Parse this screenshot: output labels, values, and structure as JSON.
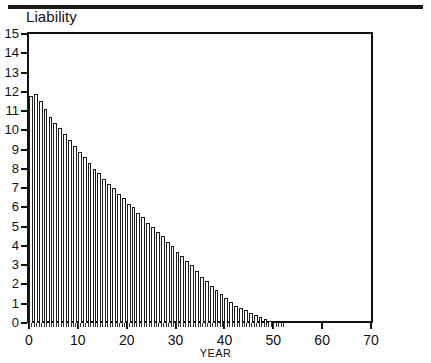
{
  "figure": {
    "title_axis_label": "Liability",
    "x_caption": "YEAR"
  },
  "chart_data": {
    "type": "bar",
    "title": "",
    "ylabel": "Liability",
    "xlabel": "YEAR",
    "ylim": [
      0,
      15
    ],
    "xlim": [
      0,
      70
    ],
    "ytick_labels": [
      "0",
      "1",
      "2",
      "3",
      "4",
      "5",
      "6",
      "7",
      "8",
      "9",
      "10",
      "11",
      "12",
      "13",
      "14",
      "15"
    ],
    "ytick_values": [
      0,
      1,
      2,
      3,
      4,
      5,
      6,
      7,
      8,
      9,
      10,
      11,
      12,
      13,
      14,
      15
    ],
    "xtick_labels": [
      "0",
      "10",
      "20",
      "30",
      "40",
      "50",
      "60",
      "70"
    ],
    "xtick_values": [
      0,
      10,
      20,
      30,
      40,
      50,
      60,
      70
    ],
    "grid": false,
    "legend": null,
    "bar_style": {
      "fill": "#ffffff",
      "edge": "#1c1c1c",
      "edge_width_px": 1
    },
    "categories": [
      1,
      2,
      3,
      4,
      5,
      6,
      7,
      8,
      9,
      10,
      11,
      12,
      13,
      14,
      15,
      16,
      17,
      18,
      19,
      20,
      21,
      22,
      23,
      24,
      25,
      26,
      27,
      28,
      29,
      30,
      31,
      32,
      33,
      34,
      35,
      36,
      37,
      38,
      39,
      40,
      41,
      42,
      43,
      44,
      45,
      46,
      47,
      48,
      49,
      50
    ],
    "values": [
      11.8,
      11.9,
      11.5,
      11.1,
      10.7,
      10.4,
      10.1,
      9.8,
      9.5,
      9.2,
      8.9,
      8.6,
      8.3,
      8.0,
      7.8,
      7.5,
      7.2,
      7.0,
      6.7,
      6.5,
      6.2,
      6.0,
      5.7,
      5.5,
      5.2,
      5.0,
      4.7,
      4.5,
      4.2,
      4.0,
      3.7,
      3.5,
      3.2,
      3.0,
      2.7,
      2.4,
      2.2,
      1.9,
      1.7,
      1.5,
      1.3,
      1.1,
      0.9,
      0.8,
      0.65,
      0.5,
      0.4,
      0.3,
      0.2,
      0.1
    ]
  }
}
